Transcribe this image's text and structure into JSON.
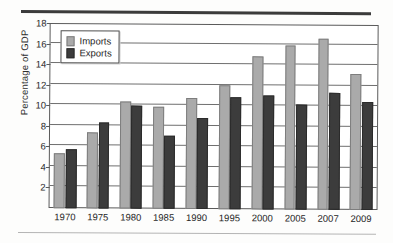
{
  "figure": {
    "y_axis_title": "Percentage of GDP",
    "top_rule": "decorative-rule",
    "bottom_rule": "decorative-rule"
  },
  "legend": {
    "items": [
      {
        "label": "Imports",
        "color": "#aaaaaa"
      },
      {
        "label": "Exports",
        "color": "#3c3c3c"
      }
    ]
  },
  "y_ticks": [
    "18",
    "16",
    "14",
    "12",
    "10",
    "8",
    "6",
    "4",
    "2"
  ],
  "chart_data": {
    "type": "bar",
    "title": "",
    "subtitle": "",
    "xlabel": "",
    "ylabel": "Percentage of GDP",
    "ylim": [
      0,
      18
    ],
    "ytick_values": [
      2,
      4,
      6,
      8,
      10,
      12,
      14,
      16,
      18
    ],
    "grid": true,
    "legend_position": "upper-left-inside",
    "categories": [
      "1970",
      "1975",
      "1980",
      "1985",
      "1990",
      "1995",
      "2000",
      "2005",
      "2007",
      "2009"
    ],
    "series": [
      {
        "name": "Imports",
        "color": "#aaaaaa",
        "values": [
          5.4,
          7.4,
          10.4,
          9.9,
          10.8,
          12.1,
          14.9,
          16.0,
          16.6,
          13.2
        ]
      },
      {
        "name": "Exports",
        "color": "#3c3c3c",
        "values": [
          5.7,
          8.4,
          10.0,
          7.1,
          8.9,
          10.9,
          11.1,
          10.2,
          11.4,
          10.5
        ]
      }
    ]
  }
}
